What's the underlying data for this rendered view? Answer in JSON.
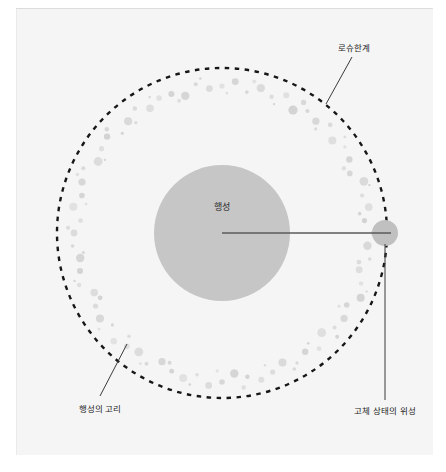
{
  "figure": {
    "title_alt": "로슈한계 다이어그램",
    "background_color": "#f5f5f5",
    "page_color": "#ffffff"
  },
  "labels": {
    "roche_limit": "로슈한계",
    "planet": "행성",
    "planet_ring": "행성의 고리",
    "solid_moon": "고체 상태의 위성"
  },
  "colors": {
    "planet_fill": "#c6c6c6",
    "moon_fill": "#c0c0c0",
    "ring_particle": "#d2d2d2",
    "roche_dash": "#171717",
    "leader_line": "#3a3a3a",
    "radius_line": "#5a5a5a",
    "text": "#1e1e1e"
  },
  "geometry": {
    "center_x": 222,
    "center_y": 233,
    "planet_radius": 68,
    "roche_radius": 165,
    "ring_inner_radius": 138,
    "ring_outer_radius": 154,
    "moon_center_x": 385,
    "moon_center_y": 233,
    "moon_radius": 13
  },
  "chart_data": {
    "type": "scatter",
    "title": "로슈한계",
    "xlabel": "",
    "ylabel": "",
    "annotations": [
      {
        "name": "roche-limit",
        "text": "로슈한계",
        "x": 353,
        "y": 48
      },
      {
        "name": "planet",
        "text": "행성",
        "x": 222,
        "y": 207
      },
      {
        "name": "planet-ring",
        "text": "행성의 고리",
        "x": 100,
        "y": 408
      },
      {
        "name": "solid-moon",
        "text": "고체 상태의 위성",
        "x": 385,
        "y": 411
      }
    ],
    "series": [
      {
        "name": "행성",
        "values": [
          {
            "x": 222,
            "y": 233,
            "r": 68
          }
        ]
      },
      {
        "name": "고체 상태의 위성",
        "values": [
          {
            "x": 385,
            "y": 233,
            "r": 13
          }
        ]
      },
      {
        "name": "로슈한계",
        "values": [
          {
            "cx": 222,
            "cy": 233,
            "r": 165
          }
        ]
      },
      {
        "name": "행성의 고리",
        "values": [
          {
            "a": 0,
            "r": 147,
            "s": 2.6
          },
          {
            "a": 5,
            "r": 152,
            "s": 3.4
          },
          {
            "a": 10,
            "r": 143,
            "s": 1.8
          },
          {
            "a": 15,
            "r": 150,
            "s": 4.2
          },
          {
            "a": 20,
            "r": 145,
            "s": 2.2
          },
          {
            "a": 25,
            "r": 152,
            "s": 3.0
          },
          {
            "a": 30,
            "r": 142,
            "s": 4.6
          },
          {
            "a": 35,
            "r": 149,
            "s": 2.0
          },
          {
            "a": 40,
            "r": 146,
            "s": 3.6
          },
          {
            "a": 45,
            "r": 153,
            "s": 2.4
          },
          {
            "a": 50,
            "r": 144,
            "s": 4.0
          },
          {
            "a": 55,
            "r": 150,
            "s": 1.6
          },
          {
            "a": 60,
            "r": 147,
            "s": 3.2
          },
          {
            "a": 65,
            "r": 141,
            "s": 2.8
          },
          {
            "a": 70,
            "r": 151,
            "s": 4.4
          },
          {
            "a": 75,
            "r": 145,
            "s": 2.0
          },
          {
            "a": 80,
            "r": 149,
            "s": 3.8
          },
          {
            "a": 85,
            "r": 143,
            "s": 2.6
          },
          {
            "a": 90,
            "r": 152,
            "s": 3.0
          },
          {
            "a": 95,
            "r": 146,
            "s": 4.2
          },
          {
            "a": 100,
            "r": 150,
            "s": 1.8
          },
          {
            "a": 105,
            "r": 142,
            "s": 3.4
          },
          {
            "a": 110,
            "r": 148,
            "s": 2.2
          },
          {
            "a": 115,
            "r": 153,
            "s": 4.0
          },
          {
            "a": 120,
            "r": 144,
            "s": 2.8
          },
          {
            "a": 125,
            "r": 149,
            "s": 3.6
          },
          {
            "a": 130,
            "r": 147,
            "s": 2.0
          },
          {
            "a": 135,
            "r": 141,
            "s": 4.4
          },
          {
            "a": 140,
            "r": 151,
            "s": 2.4
          },
          {
            "a": 145,
            "r": 145,
            "s": 3.2
          },
          {
            "a": 150,
            "r": 150,
            "s": 1.6
          },
          {
            "a": 155,
            "r": 143,
            "s": 4.0
          },
          {
            "a": 160,
            "r": 148,
            "s": 2.6
          },
          {
            "a": 165,
            "r": 152,
            "s": 3.0
          },
          {
            "a": 170,
            "r": 146,
            "s": 2.2
          },
          {
            "a": 175,
            "r": 141,
            "s": 4.2
          },
          {
            "a": 180,
            "r": 149,
            "s": 2.8
          },
          {
            "a": 185,
            "r": 153,
            "s": 3.4
          },
          {
            "a": 190,
            "r": 144,
            "s": 1.8
          },
          {
            "a": 195,
            "r": 150,
            "s": 4.0
          },
          {
            "a": 200,
            "r": 147,
            "s": 2.4
          },
          {
            "a": 205,
            "r": 142,
            "s": 3.6
          },
          {
            "a": 210,
            "r": 151,
            "s": 2.0
          },
          {
            "a": 215,
            "r": 145,
            "s": 4.4
          },
          {
            "a": 220,
            "r": 148,
            "s": 2.8
          },
          {
            "a": 225,
            "r": 153,
            "s": 3.2
          },
          {
            "a": 230,
            "r": 143,
            "s": 1.6
          },
          {
            "a": 235,
            "r": 149,
            "s": 4.0
          },
          {
            "a": 240,
            "r": 146,
            "s": 2.6
          },
          {
            "a": 245,
            "r": 141,
            "s": 3.8
          },
          {
            "a": 250,
            "r": 152,
            "s": 2.2
          },
          {
            "a": 255,
            "r": 147,
            "s": 3.0
          },
          {
            "a": 260,
            "r": 144,
            "s": 4.2
          },
          {
            "a": 265,
            "r": 150,
            "s": 1.8
          },
          {
            "a": 270,
            "r": 148,
            "s": 3.4
          },
          {
            "a": 275,
            "r": 142,
            "s": 2.4
          },
          {
            "a": 280,
            "r": 151,
            "s": 4.0
          },
          {
            "a": 285,
            "r": 145,
            "s": 2.8
          },
          {
            "a": 290,
            "r": 149,
            "s": 3.6
          },
          {
            "a": 295,
            "r": 153,
            "s": 2.0
          },
          {
            "a": 300,
            "r": 143,
            "s": 4.4
          },
          {
            "a": 305,
            "r": 147,
            "s": 2.6
          },
          {
            "a": 310,
            "r": 150,
            "s": 3.2
          },
          {
            "a": 315,
            "r": 141,
            "s": 1.6
          },
          {
            "a": 320,
            "r": 146,
            "s": 4.0
          },
          {
            "a": 325,
            "r": 152,
            "s": 2.2
          },
          {
            "a": 330,
            "r": 144,
            "s": 3.8
          },
          {
            "a": 335,
            "r": 149,
            "s": 2.8
          },
          {
            "a": 340,
            "r": 148,
            "s": 3.0
          },
          {
            "a": 345,
            "r": 142,
            "s": 4.2
          },
          {
            "a": 350,
            "r": 151,
            "s": 2.0
          },
          {
            "a": 355,
            "r": 145,
            "s": 3.4
          },
          {
            "a": 2,
            "r": 140,
            "s": 1.4
          },
          {
            "a": 12,
            "r": 155,
            "s": 2.0
          },
          {
            "a": 22,
            "r": 139,
            "s": 1.2
          },
          {
            "a": 32,
            "r": 154,
            "s": 2.6
          },
          {
            "a": 42,
            "r": 140,
            "s": 1.6
          },
          {
            "a": 52,
            "r": 156,
            "s": 1.4
          },
          {
            "a": 62,
            "r": 138,
            "s": 2.2
          },
          {
            "a": 72,
            "r": 155,
            "s": 1.2
          },
          {
            "a": 82,
            "r": 139,
            "s": 1.8
          },
          {
            "a": 92,
            "r": 154,
            "s": 1.4
          },
          {
            "a": 102,
            "r": 140,
            "s": 2.4
          },
          {
            "a": 112,
            "r": 156,
            "s": 1.2
          },
          {
            "a": 122,
            "r": 138,
            "s": 1.6
          },
          {
            "a": 132,
            "r": 155,
            "s": 2.0
          },
          {
            "a": 142,
            "r": 140,
            "s": 1.4
          },
          {
            "a": 152,
            "r": 154,
            "s": 1.8
          },
          {
            "a": 162,
            "r": 139,
            "s": 1.2
          },
          {
            "a": 172,
            "r": 156,
            "s": 2.2
          },
          {
            "a": 182,
            "r": 138,
            "s": 1.6
          },
          {
            "a": 192,
            "r": 155,
            "s": 1.4
          },
          {
            "a": 202,
            "r": 140,
            "s": 2.0
          },
          {
            "a": 212,
            "r": 154,
            "s": 1.2
          },
          {
            "a": 222,
            "r": 139,
            "s": 1.8
          },
          {
            "a": 232,
            "r": 156,
            "s": 1.4
          },
          {
            "a": 242,
            "r": 138,
            "s": 2.4
          },
          {
            "a": 252,
            "r": 155,
            "s": 1.2
          },
          {
            "a": 262,
            "r": 140,
            "s": 1.6
          },
          {
            "a": 272,
            "r": 154,
            "s": 2.0
          },
          {
            "a": 282,
            "r": 139,
            "s": 1.4
          },
          {
            "a": 292,
            "r": 156,
            "s": 1.8
          },
          {
            "a": 302,
            "r": 138,
            "s": 1.2
          },
          {
            "a": 312,
            "r": 155,
            "s": 2.2
          },
          {
            "a": 322,
            "r": 140,
            "s": 1.6
          },
          {
            "a": 332,
            "r": 154,
            "s": 1.4
          },
          {
            "a": 342,
            "r": 139,
            "s": 2.0
          },
          {
            "a": 352,
            "r": 156,
            "s": 1.2
          }
        ]
      }
    ]
  }
}
